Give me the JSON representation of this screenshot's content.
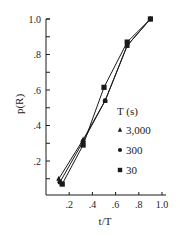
{
  "chart_data": {
    "type": "line",
    "title": "",
    "xlabel": "t/T",
    "ylabel": "p(R)",
    "xlim": [
      0,
      1.0
    ],
    "ylim": [
      0,
      1.0
    ],
    "x_ticks": [
      0.2,
      0.4,
      0.6,
      0.8,
      1.0
    ],
    "x_tick_labels": [
      ".2",
      ".4",
      ".6",
      ".8",
      "1.0"
    ],
    "y_ticks": [
      0.2,
      0.4,
      0.6,
      0.8,
      1.0
    ],
    "y_tick_labels": [
      ".2",
      ".4",
      ".6",
      ".8",
      "1.0"
    ],
    "y_minor_ticks": [
      0.1,
      0.3,
      0.5,
      0.7,
      0.9
    ],
    "grid": false,
    "legend": {
      "title": "T (s)",
      "position": "right-center"
    },
    "series": [
      {
        "name": "3,000",
        "marker": "triangle",
        "x": [
          0.11,
          0.32,
          0.51,
          0.7,
          0.9
        ],
        "y": [
          0.1,
          0.32,
          0.54,
          0.85,
          1.0
        ]
      },
      {
        "name": "300",
        "marker": "circle",
        "x": [
          0.12,
          0.32,
          0.51,
          0.7,
          0.9
        ],
        "y": [
          0.08,
          0.31,
          0.54,
          0.85,
          1.0
        ]
      },
      {
        "name": "30",
        "marker": "square",
        "x": [
          0.14,
          0.32,
          0.5,
          0.7,
          0.9
        ],
        "y": [
          0.07,
          0.29,
          0.615,
          0.87,
          1.0
        ]
      }
    ]
  },
  "colors": {
    "ink": "#1a1a1a",
    "background": "#ffffff"
  }
}
